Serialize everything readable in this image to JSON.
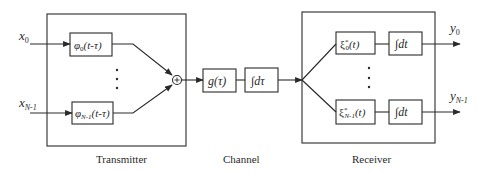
{
  "diagram": {
    "type": "block-diagram",
    "sections": {
      "transmitter": {
        "label": "Transmitter"
      },
      "channel": {
        "label": "Channel"
      },
      "receiver": {
        "label": "Receiver"
      }
    },
    "inputs": [
      {
        "id": "x0",
        "base": "x",
        "sub": "0"
      },
      {
        "id": "xN1",
        "base": "x",
        "sub": "N-1"
      }
    ],
    "transmitter_blocks": [
      {
        "id": "phi0",
        "fn": "φ",
        "sub": "0",
        "arg": "(t-τ)"
      },
      {
        "id": "phiN1",
        "fn": "φ",
        "sub": "N-1",
        "arg": "(t-τ)"
      }
    ],
    "summer": {
      "symbol": "+"
    },
    "channel_blocks": [
      {
        "id": "g",
        "text": "g(τ)"
      },
      {
        "id": "int_tau",
        "integral": "∫",
        "text": "dτ"
      }
    ],
    "receiver_blocks": [
      {
        "id": "xi0",
        "fn": "ξ",
        "sup": "*",
        "sub": "0",
        "arg": "(t)"
      },
      {
        "id": "xiN1",
        "fn": "ξ",
        "sup": "*",
        "sub": "N-1",
        "arg": "(t)"
      }
    ],
    "receiver_integrators": [
      {
        "id": "int0",
        "integral": "∫",
        "text": "dt"
      },
      {
        "id": "intN1",
        "integral": "∫",
        "text": "dt"
      }
    ],
    "outputs": [
      {
        "id": "y0",
        "base": "y",
        "sub": "0"
      },
      {
        "id": "yN1",
        "base": "y",
        "sub": "N-1"
      }
    ],
    "ellipsis": "⋮",
    "colors": {
      "stroke": "#2a2a2a",
      "background": "#ffffff"
    }
  }
}
